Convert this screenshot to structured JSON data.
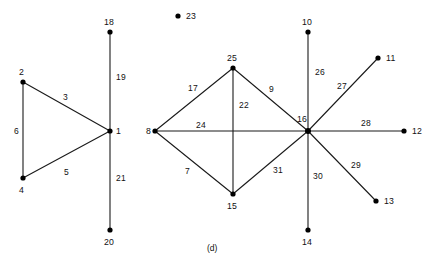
{
  "figure": {
    "caption": "(d)",
    "caption_pos": {
      "x": 207,
      "y": 243
    },
    "width": 431,
    "height": 269,
    "background": "#ffffff",
    "edge_color": "#1a1a1a",
    "node_color": "#000000"
  },
  "graph_data": {
    "type": "node-link-diagram",
    "components": 3,
    "nodes": [
      {
        "id": "2",
        "label": "2",
        "x": 23,
        "y": 82,
        "lx": 19,
        "ly": 68,
        "r": 2.6
      },
      {
        "id": "4",
        "label": "4",
        "x": 23,
        "y": 178,
        "lx": 19,
        "ly": 186,
        "r": 2.6
      },
      {
        "id": "1",
        "label": "1",
        "x": 110,
        "y": 131,
        "lx": 116,
        "ly": 127,
        "r": 2.6
      },
      {
        "id": "18",
        "label": "18",
        "x": 110,
        "y": 32,
        "lx": 104,
        "ly": 18,
        "r": 2.6
      },
      {
        "id": "20",
        "label": "20",
        "x": 110,
        "y": 230,
        "lx": 104,
        "ly": 238,
        "r": 2.6
      },
      {
        "id": "23",
        "label": "23",
        "x": 178,
        "y": 16,
        "lx": 186,
        "ly": 12,
        "r": 2.6
      },
      {
        "id": "8",
        "label": "8",
        "x": 155,
        "y": 131,
        "lx": 146,
        "ly": 127,
        "r": 2.6
      },
      {
        "id": "25",
        "label": "25",
        "x": 233,
        "y": 68,
        "lx": 227,
        "ly": 54,
        "r": 2.6
      },
      {
        "id": "15",
        "label": "15",
        "x": 233,
        "y": 194,
        "lx": 227,
        "ly": 202,
        "r": 2.6
      },
      {
        "id": "16",
        "label": "16",
        "x": 308,
        "y": 131,
        "lx": 297,
        "ly": 115,
        "r": 3.0
      },
      {
        "id": "10",
        "label": "10",
        "x": 308,
        "y": 32,
        "lx": 302,
        "ly": 18,
        "r": 2.6
      },
      {
        "id": "14",
        "label": "14",
        "x": 308,
        "y": 230,
        "lx": 302,
        "ly": 238,
        "r": 2.6
      },
      {
        "id": "11",
        "label": "11",
        "x": 378,
        "y": 58,
        "lx": 386,
        "ly": 54,
        "r": 2.6
      },
      {
        "id": "12",
        "label": "12",
        "x": 404,
        "y": 131,
        "lx": 412,
        "ly": 127,
        "r": 2.6
      },
      {
        "id": "13",
        "label": "13",
        "x": 376,
        "y": 201,
        "lx": 384,
        "ly": 197,
        "r": 2.6
      }
    ],
    "edges": [
      {
        "label": "3",
        "source": "2",
        "target": "1",
        "x1": 23,
        "y1": 82,
        "x2": 110,
        "y2": 131,
        "lx": 63,
        "ly": 93
      },
      {
        "label": "6",
        "source": "2",
        "target": "4",
        "x1": 23,
        "y1": 82,
        "x2": 23,
        "y2": 178,
        "lx": 14,
        "ly": 127
      },
      {
        "label": "5",
        "source": "4",
        "target": "1",
        "x1": 23,
        "y1": 178,
        "x2": 110,
        "y2": 131,
        "lx": 64,
        "ly": 168
      },
      {
        "label": "19",
        "source": "18",
        "target": "1",
        "x1": 110,
        "y1": 32,
        "x2": 110,
        "y2": 131,
        "lx": 116,
        "ly": 73
      },
      {
        "label": "21",
        "source": "1",
        "target": "20",
        "x1": 110,
        "y1": 131,
        "x2": 110,
        "y2": 230,
        "lx": 116,
        "ly": 174
      },
      {
        "label": "17",
        "source": "8",
        "target": "25",
        "x1": 155,
        "y1": 131,
        "x2": 233,
        "y2": 68,
        "lx": 188,
        "ly": 84
      },
      {
        "label": "24",
        "source": "8",
        "target": "16",
        "x1": 155,
        "y1": 131,
        "x2": 308,
        "y2": 131,
        "lx": 196,
        "ly": 121
      },
      {
        "label": "7",
        "source": "8",
        "target": "15",
        "x1": 155,
        "y1": 131,
        "x2": 233,
        "y2": 194,
        "lx": 185,
        "ly": 167
      },
      {
        "label": "22",
        "source": "25",
        "target": "15",
        "x1": 233,
        "y1": 68,
        "x2": 233,
        "y2": 194,
        "lx": 239,
        "ly": 101
      },
      {
        "label": "9",
        "source": "25",
        "target": "16",
        "x1": 233,
        "y1": 68,
        "x2": 308,
        "y2": 131,
        "lx": 269,
        "ly": 85
      },
      {
        "label": "31",
        "source": "15",
        "target": "16",
        "x1": 233,
        "y1": 194,
        "x2": 308,
        "y2": 131,
        "lx": 273,
        "ly": 166
      },
      {
        "label": "26",
        "source": "10",
        "target": "16",
        "x1": 308,
        "y1": 32,
        "x2": 308,
        "y2": 131,
        "lx": 315,
        "ly": 68
      },
      {
        "label": "27",
        "source": "16",
        "target": "11",
        "x1": 308,
        "y1": 131,
        "x2": 378,
        "y2": 58,
        "lx": 337,
        "ly": 82
      },
      {
        "label": "28",
        "source": "16",
        "target": "12",
        "x1": 308,
        "y1": 131,
        "x2": 404,
        "y2": 131,
        "lx": 361,
        "ly": 119
      },
      {
        "label": "29",
        "source": "16",
        "target": "13",
        "x1": 308,
        "y1": 131,
        "x2": 376,
        "y2": 201,
        "lx": 351,
        "ly": 161
      },
      {
        "label": "30",
        "source": "16",
        "target": "14",
        "x1": 308,
        "y1": 131,
        "x2": 308,
        "y2": 230,
        "lx": 313,
        "ly": 172
      }
    ],
    "isolated_nodes": [
      "23"
    ]
  }
}
